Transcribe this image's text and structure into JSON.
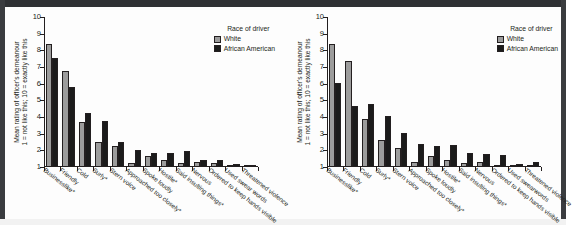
{
  "figure": {
    "legend_title": "Race of driver",
    "series_names": [
      "White",
      "African American"
    ],
    "colors": {
      "white": "#9c9c9c",
      "african_american": "#1b1b1b",
      "axis": "#231f20"
    },
    "y_axis_title_line1": "Mean rating of officer's demeanour",
    "y_axis_title_line2": "1 = not like this; 10 = exactly like this",
    "y_ticks": [
      "1",
      "2",
      "3",
      "4",
      "5",
      "6",
      "7",
      "8",
      "9",
      "10"
    ]
  },
  "chart_data": [
    {
      "type": "bar",
      "title": "",
      "panel": "left",
      "xlabel": "",
      "ylabel": "Mean rating of officer's demeanour 1 = not like this; 10 = exactly like this",
      "ylim": [
        1,
        10
      ],
      "grid": false,
      "legend_position": "top-right",
      "legend_title": "Race of driver",
      "categories": [
        "Businesslike*",
        "Friendly",
        "Cold",
        "Surly*",
        "Stern voice",
        "Approached too closely*",
        "Spoke loudly",
        "Hostile*",
        "Said insulting things*",
        "Nervous",
        "Ordered to keep hands visible",
        "Used swear words",
        "Threatened violence"
      ],
      "series": [
        {
          "name": "White",
          "values": [
            8.4,
            6.75,
            3.68,
            2.48,
            2.28,
            1.25,
            1.68,
            1.43,
            1.22,
            1.3,
            1.22,
            1.07,
            1.02
          ]
        },
        {
          "name": "African American",
          "values": [
            7.57,
            5.83,
            4.25,
            3.74,
            2.53,
            2.0,
            1.83,
            1.85,
            1.95,
            1.4,
            1.4,
            1.2,
            1.12
          ]
        }
      ]
    },
    {
      "type": "bar",
      "title": "",
      "panel": "right",
      "xlabel": "",
      "ylabel": "Mean rating of officer's demeanour 1 = not like this; 10 = exactly like this",
      "ylim": [
        1,
        10
      ],
      "grid": false,
      "legend_position": "top-right",
      "legend_title": "Race of driver",
      "categories": [
        "Businesslike*",
        "Friendly",
        "Cold",
        "Surly*",
        "Stern voice",
        "Approached too closely*",
        "Spoke loudly",
        "Hostile*",
        "Said insulting things*",
        "Nervous",
        "Ordered to keep hands visible",
        "Used swearwords",
        "Threatened violence"
      ],
      "series": [
        {
          "name": "White",
          "values": [
            8.38,
            7.35,
            3.9,
            2.6,
            2.12,
            1.3,
            1.68,
            1.43,
            1.22,
            1.3,
            1.15,
            1.08,
            1.1
          ]
        },
        {
          "name": "African American",
          "values": [
            6.03,
            4.65,
            4.8,
            4.08,
            3.05,
            2.4,
            2.25,
            2.33,
            1.87,
            1.77,
            1.72,
            1.2,
            1.33
          ]
        }
      ]
    }
  ]
}
